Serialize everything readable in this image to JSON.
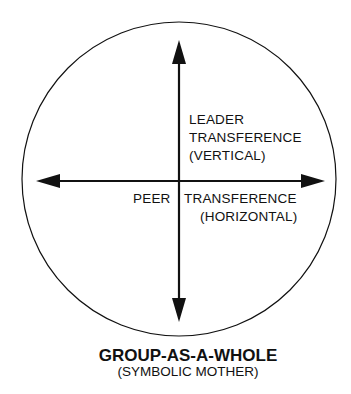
{
  "diagram": {
    "type": "circle-with-crossed-arrows",
    "colors": {
      "stroke": "#111111",
      "background": "#ffffff"
    },
    "vertical_axis": {
      "label_lines": [
        "LEADER",
        "TRANSFERENCE",
        "(VERTICAL)"
      ],
      "arrows": [
        "up",
        "down"
      ]
    },
    "horizontal_axis": {
      "label_lines": [
        "PEER",
        "TRANSFERENCE",
        "(HORIZONTAL)"
      ],
      "arrows": [
        "left",
        "right"
      ]
    },
    "caption": {
      "title": "GROUP-AS-A-WHOLE",
      "subtitle": "(SYMBOLIC MOTHER)"
    }
  }
}
